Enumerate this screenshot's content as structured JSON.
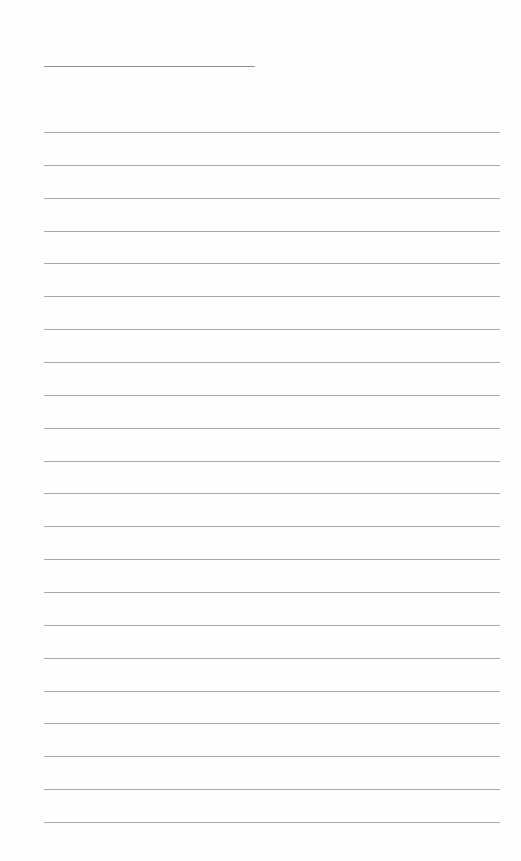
{
  "page": {
    "type": "lined-paper",
    "background": "#fefefe",
    "line_color": "#a9a9a9",
    "header_line": {
      "left": 44,
      "top": 66,
      "width": 211
    },
    "rules": {
      "count": 22,
      "left": 44,
      "width": 456,
      "first_top": 132,
      "spacing": 32.86
    },
    "text": []
  }
}
